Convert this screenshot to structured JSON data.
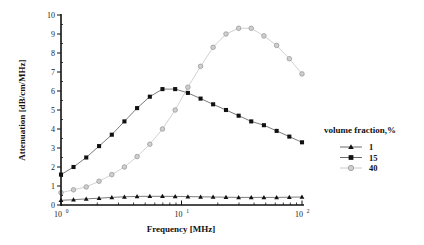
{
  "chart_data": {
    "type": "line",
    "title": "",
    "xlabel": "Frequency [MHz]",
    "ylabel": "Attenuation [dB/cm/MHz]",
    "xscale": "log",
    "xlim": [
      1,
      100
    ],
    "ylim": [
      0,
      10
    ],
    "x_ticks": [
      {
        "value": 1,
        "base": "10",
        "exp": "0"
      },
      {
        "value": 10,
        "base": "10",
        "exp": "1"
      },
      {
        "value": 100,
        "base": "10",
        "exp": "2"
      }
    ],
    "y_ticks": [
      0,
      1,
      2,
      3,
      4,
      5,
      6,
      7,
      8,
      9,
      10
    ],
    "grid": false,
    "legend": {
      "title": "volume fraction,%",
      "position": "right"
    },
    "x": [
      1.0,
      1.27,
      1.62,
      2.07,
      2.64,
      3.36,
      4.28,
      5.46,
      6.95,
      8.86,
      11.3,
      14.4,
      18.3,
      23.4,
      29.8,
      37.9,
      48.3,
      61.6,
      78.5,
      100.0
    ],
    "series": [
      {
        "name": "1",
        "marker": "triangle",
        "color": "#111111",
        "values": [
          0.25,
          0.28,
          0.32,
          0.36,
          0.4,
          0.43,
          0.45,
          0.46,
          0.46,
          0.45,
          0.44,
          0.43,
          0.42,
          0.41,
          0.4,
          0.4,
          0.4,
          0.4,
          0.41,
          0.42
        ]
      },
      {
        "name": "15",
        "marker": "square",
        "color": "#111111",
        "values": [
          1.6,
          2.0,
          2.5,
          3.1,
          3.7,
          4.4,
          5.1,
          5.7,
          6.1,
          6.1,
          5.9,
          5.6,
          5.3,
          5.0,
          4.7,
          4.4,
          4.2,
          3.9,
          3.6,
          3.3
        ]
      },
      {
        "name": "40",
        "marker": "circle",
        "color": "#9a9a9a",
        "values": [
          0.65,
          0.8,
          0.95,
          1.25,
          1.6,
          2.0,
          2.55,
          3.2,
          4.0,
          5.0,
          6.2,
          7.3,
          8.3,
          9.0,
          9.3,
          9.3,
          8.9,
          8.4,
          7.7,
          6.9
        ]
      }
    ]
  }
}
